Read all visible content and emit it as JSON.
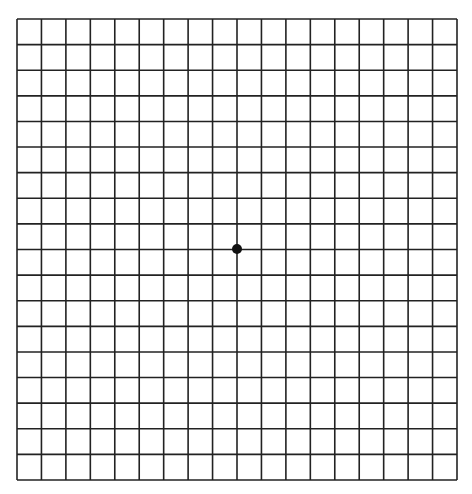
{
  "grid": {
    "type": "amsler-grid",
    "left": 17,
    "top": 19,
    "right": 457,
    "bottom": 480,
    "columns": 18,
    "rows": 18,
    "line_color": "#222222",
    "line_width": 1.6,
    "background": "#ffffff"
  },
  "fixation_dot": {
    "cx": 237,
    "cy": 249,
    "r": 5,
    "color": "#111111"
  }
}
